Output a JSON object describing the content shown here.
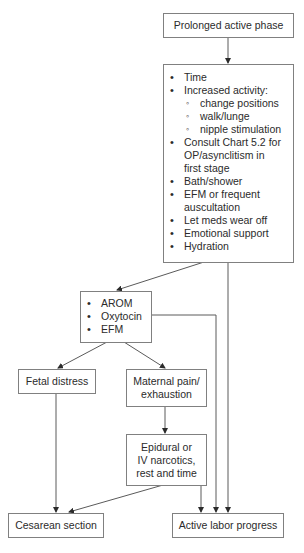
{
  "diagram": {
    "type": "flowchart",
    "nodes": {
      "prolonged": {
        "label": "Prolonged active phase"
      },
      "interventions": {
        "items": [
          {
            "level": 1,
            "text": "Time"
          },
          {
            "level": 1,
            "text": "Increased activity:"
          },
          {
            "level": 2,
            "text": "change positions"
          },
          {
            "level": 2,
            "text": "walk/lunge"
          },
          {
            "level": 2,
            "text": "nipple stimulation"
          },
          {
            "level": 1,
            "text": "Consult Chart 5.2 for"
          },
          {
            "level": 0,
            "text": "OP/asynclitism in"
          },
          {
            "level": 0,
            "text": "first stage"
          },
          {
            "level": 1,
            "text": "Bath/shower"
          },
          {
            "level": 1,
            "text": "EFM or frequent"
          },
          {
            "level": 0,
            "text": "auscultation"
          },
          {
            "level": 1,
            "text": "Let meds wear off"
          },
          {
            "level": 1,
            "text": "Emotional support"
          },
          {
            "level": 1,
            "text": "Hydration"
          }
        ]
      },
      "arom": {
        "items": [
          "AROM",
          "Oxytocin",
          "EFM"
        ]
      },
      "fetal": {
        "label": "Fetal distress"
      },
      "maternal": {
        "line1": "Maternal pain/",
        "line2": "exhaustion"
      },
      "epidural": {
        "line1": "Epidural or",
        "line2": "IV narcotics,",
        "line3": "rest and time"
      },
      "cesarean": {
        "label": "Cesarean section"
      },
      "active": {
        "label": "Active labor progress"
      }
    },
    "edges": [
      [
        "prolonged",
        "interventions"
      ],
      [
        "interventions",
        "arom"
      ],
      [
        "interventions",
        "active"
      ],
      [
        "arom",
        "fetal"
      ],
      [
        "arom",
        "maternal"
      ],
      [
        "arom",
        "active"
      ],
      [
        "fetal",
        "cesarean"
      ],
      [
        "maternal",
        "epidural"
      ],
      [
        "epidural",
        "cesarean"
      ],
      [
        "epidural",
        "active"
      ]
    ],
    "colors": {
      "line": "#5a5a5a",
      "border": "#808080",
      "text": "#2b2b2b"
    }
  }
}
